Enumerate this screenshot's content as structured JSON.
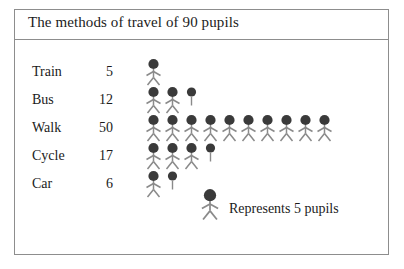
{
  "chart_data": {
    "type": "pictogram",
    "title": "The methods of travel of 90 pupils",
    "unit_value": 5,
    "unit_label": "Represents 5 pupils",
    "total": 90,
    "xlabel": "",
    "ylabel": "",
    "grid": false,
    "categories": [
      "Train",
      "Bus",
      "Walk",
      "Cycle",
      "Car"
    ],
    "values": [
      5,
      12,
      50,
      17,
      6
    ],
    "rows": [
      {
        "label": "Train",
        "value": "5",
        "full_icons": 1,
        "partial": "none"
      },
      {
        "label": "Bus",
        "value": "12",
        "full_icons": 2,
        "partial": "stem"
      },
      {
        "label": "Walk",
        "value": "50",
        "full_icons": 10,
        "partial": "none"
      },
      {
        "label": "Cycle",
        "value": "17",
        "full_icons": 3,
        "partial": "stem"
      },
      {
        "label": "Car",
        "value": "6",
        "full_icons": 1,
        "partial": "stem"
      }
    ]
  },
  "legend": {
    "icon": "stick-figure-icon",
    "text": "Represents 5 pupils"
  },
  "colors": {
    "head": "#3a3a3a",
    "limb": "#8a8a8a",
    "border": "#8d8d8d",
    "text": "#1b1b1b",
    "background": "#ffffff"
  }
}
